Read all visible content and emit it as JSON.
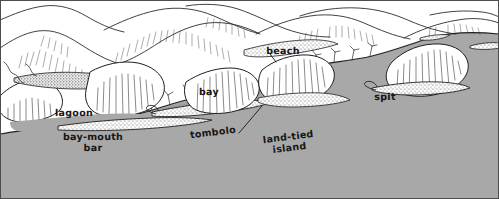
{
  "figure": {
    "kind": "coastal-landform-block-diagram",
    "title_visible": false,
    "width": 499,
    "height": 199
  },
  "colors": {
    "sea": "#a8a8a8",
    "sea_shadow": "#9a9a9a",
    "land": "#ffffff",
    "ink": "#161616",
    "line": "#2b2b2b",
    "hachure": "#3c3c3c",
    "stipple": "#5a5a5a",
    "border": "#4d4d4d"
  },
  "labels": [
    {
      "name": "lagoon",
      "text": "lagoon",
      "x": 74,
      "y": 113,
      "rotated": false
    },
    {
      "name": "bay-mouth-bar",
      "text": "bay-mouth\nbar",
      "x": 93,
      "y": 143,
      "rotated": false
    },
    {
      "name": "tombolo",
      "text": "tombolo",
      "x": 213,
      "y": 133,
      "rotated": true
    },
    {
      "name": "bay",
      "text": "bay",
      "x": 209,
      "y": 92,
      "rotated": false
    },
    {
      "name": "land-tied-island",
      "text": "land-tied\nisland",
      "x": 289,
      "y": 143,
      "rotated": true
    },
    {
      "name": "beach",
      "text": "beach",
      "x": 283,
      "y": 51,
      "rotated": false
    },
    {
      "name": "spit",
      "text": "spit",
      "x": 385,
      "y": 97,
      "rotated": false
    }
  ],
  "features": {
    "hills": [
      {
        "name": "hill-far-left-ridge"
      },
      {
        "name": "hill-left-rounded"
      },
      {
        "name": "hill-center-ridge"
      },
      {
        "name": "hill-center-right-ridge"
      },
      {
        "name": "hill-right-ridge"
      }
    ],
    "headlands": [
      {
        "name": "headland-far-left"
      },
      {
        "name": "headland-left"
      },
      {
        "name": "headland-center"
      },
      {
        "name": "headland-land-tied-island"
      },
      {
        "name": "headland-right"
      }
    ],
    "depositional_bars": [
      {
        "name": "bar-far-left-stippled"
      },
      {
        "name": "bar-bay-mouth"
      },
      {
        "name": "bar-tombolo"
      },
      {
        "name": "bar-beach-pocket"
      },
      {
        "name": "bar-spit-hook"
      },
      {
        "name": "bar-offshore-small"
      },
      {
        "name": "bar-offshore-far-right"
      }
    ],
    "water_bodies": [
      {
        "name": "water-lagoon"
      },
      {
        "name": "water-bay"
      },
      {
        "name": "water-open-sea"
      }
    ]
  }
}
